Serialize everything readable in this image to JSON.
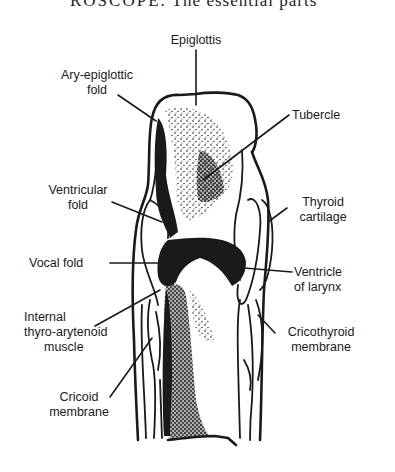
{
  "page": {
    "header_fragment_caps": "ROSCOPE.",
    "header_fragment_text": "The essential parts"
  },
  "figure": {
    "labels": {
      "epiglottis": "Epiglottis",
      "ary_epiglottic_fold_1": "Ary-epiglottic",
      "ary_epiglottic_fold_2": "fold",
      "tubercle": "Tubercle",
      "ventricular_fold_1": "Ventricular",
      "ventricular_fold_2": "fold",
      "thyroid_cartilage_1": "Thyroid",
      "thyroid_cartilage_2": "cartilage",
      "vocal_fold": "Vocal fold",
      "ventricle_of_larynx_1": "Ventricle",
      "ventricle_of_larynx_2": "of larynx",
      "internal_thyro_arytenoid_1": "Internal",
      "internal_thyro_arytenoid_2": "thyro-arytenoid",
      "internal_thyro_arytenoid_3": "muscle",
      "cricothyroid_membrane_1": "Cricothyroid",
      "cricothyroid_membrane_2": "membrane",
      "cricoid_membrane_1": "Cricoid",
      "cricoid_membrane_2": "membrane"
    },
    "colors": {
      "ink": "#1a1a1a",
      "paper": "#ffffff"
    }
  }
}
